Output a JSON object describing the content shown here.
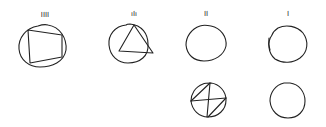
{
  "diagram": {
    "background": "#ffffff",
    "stroke_color": "#222222",
    "figures": [
      {
        "id": "circle-inscribed-square",
        "label": "IIII",
        "cx": 45,
        "cy": 47,
        "r": 21,
        "inscribed": "square"
      },
      {
        "id": "circle-inscribed-triangle",
        "label": "ıIı",
        "cx": 128,
        "cy": 45,
        "r": 20,
        "inscribed": "triangle"
      },
      {
        "id": "circle-two-marks",
        "label": "II",
        "cx": 207,
        "cy": 45,
        "r": 20,
        "inscribed": "none"
      },
      {
        "id": "circle-one-mark",
        "label": "I",
        "cx": 287,
        "cy": 45,
        "r": 20,
        "inscribed": "none"
      },
      {
        "id": "circle-inscribed-cross",
        "label": "",
        "cx": 209,
        "cy": 101,
        "r": 18,
        "inscribed": "cross-diagonals"
      },
      {
        "id": "circle-empty",
        "label": "",
        "cx": 288,
        "cy": 102,
        "r": 19,
        "inscribed": "none"
      }
    ]
  }
}
